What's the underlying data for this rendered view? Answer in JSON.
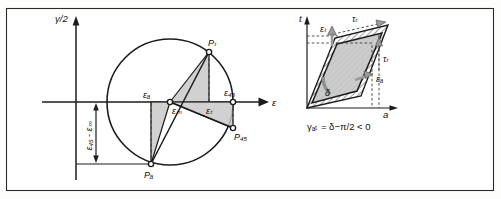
{
  "figure": {
    "title_none": "",
    "background": "#fdfdfb",
    "frame_color": "#2a2a2a",
    "fill_gray": "#c9c9c9",
    "line_color": "#1c1c1c"
  },
  "left_panel": {
    "name": "Mohr circle of strain",
    "y_axis_label": "γ/2",
    "x_axis_label": "ε",
    "bracket_label": "ε₄₅ - εₘ",
    "strain_labels": {
      "eps_a": "εₐ",
      "eps_M": "εₘ",
      "eps_t": "εₜ",
      "eps_45": "ε₄₅"
    },
    "points": {
      "p_t": "Pₜ",
      "p_45": "P₄₅",
      "p_a": "Pₐ"
    }
  },
  "right_panel": {
    "name": "Deformed element parallelogram",
    "t_axis_label": "t",
    "a_axis_label": "a",
    "angle_label": "δ",
    "shear_top_label": "τₜ",
    "shear_right_label": "τₜ",
    "strain_t_label": "εₜ",
    "strain_a_label": "εₐ",
    "equation": "γₐₜ = δ−π/2 < 0"
  }
}
